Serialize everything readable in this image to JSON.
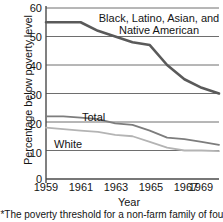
{
  "chart_data": {
    "type": "line",
    "title": "",
    "xlabel": "Year",
    "ylabel": "Percentage below poverty level",
    "footnote": "*The poverty threshold for a non-farm family of four",
    "x": [
      1959,
      1960,
      1961,
      1962,
      1963,
      1964,
      1965,
      1966,
      1967,
      1968,
      1969
    ],
    "xlim": [
      1959,
      1969
    ],
    "ylim": [
      0,
      60
    ],
    "yticks": [
      0,
      10,
      20,
      30,
      40,
      50,
      60
    ],
    "xticks": [
      1959,
      1961,
      1963,
      1965,
      1967,
      1969
    ],
    "grid": "horizontal",
    "legend_position": "inline-annotations",
    "series": [
      {
        "name": "Black, Latino, Asian, and Native American",
        "label_lines": [
          "Black, Latino, Asian, and",
          "Native American"
        ],
        "color": "#5a5a5a",
        "width": 2.6,
        "values": [
          55,
          55,
          55,
          52,
          50,
          48,
          47,
          40,
          35,
          32,
          30
        ]
      },
      {
        "name": "Total",
        "label_lines": [
          "Total"
        ],
        "color": "#7d7d7d",
        "width": 1.8,
        "values": [
          22,
          22,
          21.5,
          21,
          19.5,
          19,
          17,
          14.5,
          14,
          13,
          12
        ]
      },
      {
        "name": "White",
        "label_lines": [
          "White"
        ],
        "color": "#b4b4b4",
        "width": 1.8,
        "values": [
          18,
          17.5,
          17,
          16.5,
          15.5,
          15,
          13,
          11,
          10,
          10,
          9.8
        ]
      }
    ]
  },
  "axis": {
    "ytick_labels": [
      "60",
      "50",
      "40",
      "30",
      "20",
      "10",
      "0"
    ],
    "xtick_labels": [
      "1959",
      "1961",
      "1963",
      "1965",
      "1967",
      "1969"
    ]
  }
}
